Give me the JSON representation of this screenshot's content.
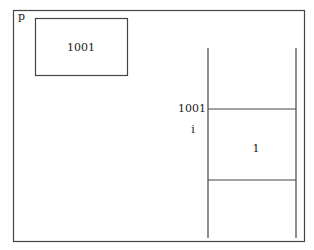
{
  "diagram": {
    "frame_label": "p",
    "pointer_box": {
      "value": "1001"
    },
    "memory": {
      "address_label": "1001",
      "variable_label": "i",
      "cell_value": "1"
    }
  }
}
